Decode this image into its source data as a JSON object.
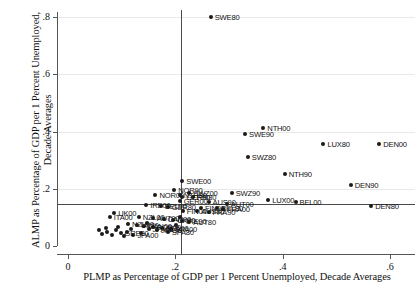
{
  "chart_data": {
    "type": "scatter",
    "title": "",
    "xlabel": "PLMP as Percentage of GDP per 1 Percent Unemployed, Decade Averages",
    "ylabel": "ALMP as Percentage of GDP per 1 Percent Unemployed, Decade Averages",
    "xlim": [
      -0.02,
      0.655
    ],
    "ylim": [
      -0.02,
      0.845
    ],
    "xticks": [
      0,
      0.2,
      0.4,
      0.6
    ],
    "xticklabels": [
      "0",
      ".2",
      ".4",
      ".6"
    ],
    "yticks": [
      0,
      0.2,
      0.4,
      0.6,
      0.8
    ],
    "yticklabels": [
      "0",
      ".2",
      ".4",
      ".6",
      ".8"
    ],
    "grid": "horizontal-faint",
    "legend": "none",
    "reference_lines": {
      "vertical_x": 0.21,
      "horizontal_y": 0.145
    },
    "points": [
      {
        "label": "SWE80",
        "x": 0.266,
        "y": 0.8,
        "label_pos": "right"
      },
      {
        "label": "SWE90",
        "x": 0.33,
        "y": 0.392,
        "label_pos": "right"
      },
      {
        "label": "NTH00",
        "x": 0.364,
        "y": 0.412,
        "label_pos": "right"
      },
      {
        "label": "LUX80",
        "x": 0.476,
        "y": 0.358,
        "label_pos": "right"
      },
      {
        "label": "DEN00",
        "x": 0.58,
        "y": 0.358,
        "label_pos": "right"
      },
      {
        "label": "SWZ80",
        "x": 0.335,
        "y": 0.312,
        "label_pos": "right"
      },
      {
        "label": "NTH90",
        "x": 0.404,
        "y": 0.252,
        "label_pos": "right"
      },
      {
        "label": "DEN90",
        "x": 0.527,
        "y": 0.212,
        "label_pos": "right"
      },
      {
        "label": "SWE00",
        "x": 0.213,
        "y": 0.228,
        "label_pos": "right"
      },
      {
        "label": "SWZ90",
        "x": 0.305,
        "y": 0.185,
        "label_pos": "right"
      },
      {
        "label": "LUX00",
        "x": 0.373,
        "y": 0.16,
        "label_pos": "right"
      },
      {
        "label": "BEL00",
        "x": 0.424,
        "y": 0.152,
        "label_pos": "right"
      },
      {
        "label": "DEN80",
        "x": 0.565,
        "y": 0.14,
        "label_pos": "right"
      },
      {
        "label": "NOR90",
        "x": 0.198,
        "y": 0.195,
        "label_pos": "right"
      },
      {
        "label": "NOR00",
        "x": 0.163,
        "y": 0.178,
        "label_pos": "right"
      },
      {
        "label": "SWZ00",
        "x": 0.226,
        "y": 0.184,
        "label_pos": "right"
      },
      {
        "label": "NTH80",
        "x": 0.208,
        "y": 0.178,
        "label_pos": "right"
      },
      {
        "label": "GER90",
        "x": 0.213,
        "y": 0.17,
        "label_pos": "right"
      },
      {
        "label": "FIN80",
        "x": 0.232,
        "y": 0.171,
        "label_pos": "right"
      },
      {
        "label": "GER00",
        "x": 0.208,
        "y": 0.158,
        "label_pos": "right"
      },
      {
        "label": "AUS90",
        "x": 0.262,
        "y": 0.152,
        "label_pos": "right"
      },
      {
        "label": "AUT00",
        "x": 0.296,
        "y": 0.148,
        "label_pos": "right"
      },
      {
        "label": "IRE00",
        "x": 0.146,
        "y": 0.143,
        "label_pos": "right"
      },
      {
        "label": "BEL90",
        "x": 0.173,
        "y": 0.141,
        "label_pos": "right"
      },
      {
        "label": "GER80",
        "x": 0.186,
        "y": 0.136,
        "label_pos": "right"
      },
      {
        "label": "FIN90",
        "x": 0.248,
        "y": 0.134,
        "label_pos": "right"
      },
      {
        "label": "BEL80",
        "x": 0.278,
        "y": 0.132,
        "label_pos": "right"
      },
      {
        "label": "FRA00",
        "x": 0.289,
        "y": 0.13,
        "label_pos": "right"
      },
      {
        "label": "FIN00",
        "x": 0.214,
        "y": 0.124,
        "label_pos": "right"
      },
      {
        "label": "AUS80",
        "x": 0.241,
        "y": 0.122,
        "label_pos": "right"
      },
      {
        "label": "FRA90",
        "x": 0.262,
        "y": 0.12,
        "label_pos": "right"
      },
      {
        "label": "UK00",
        "x": 0.086,
        "y": 0.116,
        "label_pos": "right"
      },
      {
        "label": "ITA00",
        "x": 0.078,
        "y": 0.103,
        "label_pos": "right"
      },
      {
        "label": "NZL00",
        "x": 0.132,
        "y": 0.1,
        "label_pos": "right"
      },
      {
        "label": "AUT90",
        "x": 0.158,
        "y": 0.097,
        "label_pos": "right"
      },
      {
        "label": "CAN90",
        "x": 0.178,
        "y": 0.093,
        "label_pos": "right"
      },
      {
        "label": "UK90",
        "x": 0.196,
        "y": 0.09,
        "label_pos": "right"
      },
      {
        "label": "IRE90",
        "x": 0.213,
        "y": 0.088,
        "label_pos": "right"
      },
      {
        "label": "AUT80",
        "x": 0.226,
        "y": 0.085,
        "label_pos": "right"
      },
      {
        "label": "NZL90",
        "x": 0.112,
        "y": 0.078,
        "label_pos": "right"
      },
      {
        "label": "UK80",
        "x": 0.128,
        "y": 0.074,
        "label_pos": "right"
      },
      {
        "label": "CAN00",
        "x": 0.142,
        "y": 0.07,
        "label_pos": "right"
      },
      {
        "label": "POR00",
        "x": 0.158,
        "y": 0.067,
        "label_pos": "right"
      },
      {
        "label": "SPA90",
        "x": 0.176,
        "y": 0.064,
        "label_pos": "right"
      },
      {
        "label": "SPA00",
        "x": 0.192,
        "y": 0.061,
        "label_pos": "right"
      },
      {
        "label": "JPA80",
        "x": 0.15,
        "y": 0.058,
        "label_pos": "right"
      },
      {
        "label": "JPA90",
        "x": 0.166,
        "y": 0.055,
        "label_pos": "right"
      },
      {
        "label": "GRE80",
        "x": 0.098,
        "y": 0.046,
        "label_pos": "right"
      },
      {
        "label": "POR90",
        "x": 0.11,
        "y": 0.05,
        "label_pos": "right"
      },
      {
        "label": "ITA90",
        "x": 0.09,
        "y": 0.055,
        "label_pos": "right"
      },
      {
        "label": "USA90",
        "x": 0.072,
        "y": 0.048,
        "label_pos": "right"
      },
      {
        "label": "USA00",
        "x": 0.064,
        "y": 0.042,
        "label_pos": "right"
      },
      {
        "label": "GRE90",
        "x": 0.082,
        "y": 0.038,
        "label_pos": "right"
      },
      {
        "label": "GRE00",
        "x": 0.104,
        "y": 0.035,
        "label_pos": "right"
      },
      {
        "label": "JPA00",
        "x": 0.122,
        "y": 0.04,
        "label_pos": "right"
      },
      {
        "label": "POR80",
        "x": 0.136,
        "y": 0.044,
        "label_pos": "right"
      },
      {
        "label": "SPA80",
        "x": 0.186,
        "y": 0.048,
        "label_pos": "right"
      },
      {
        "label": "CAN80",
        "x": 0.118,
        "y": 0.058,
        "label_pos": "right"
      },
      {
        "label": "ITA80",
        "x": 0.07,
        "y": 0.062,
        "label_pos": "right"
      },
      {
        "label": "USA80",
        "x": 0.058,
        "y": 0.055,
        "label_pos": "right"
      },
      {
        "label": "NZL80",
        "x": 0.094,
        "y": 0.068,
        "label_pos": "right"
      },
      {
        "label": "IRE80",
        "x": 0.148,
        "y": 0.082,
        "label_pos": "right"
      },
      {
        "label": "FRA80",
        "x": 0.202,
        "y": 0.075,
        "label_pos": "right"
      },
      {
        "label": "AUS00",
        "x": 0.208,
        "y": 0.1,
        "label_pos": "right"
      }
    ],
    "visible_labels": [
      "SWE80",
      "SWE90",
      "NTH00",
      "LUX80",
      "DEN00",
      "SWZ80",
      "NTH90",
      "DEN90",
      "SWE00",
      "SWZ90",
      "LUX00",
      "BEL00",
      "DEN80",
      "NOR90",
      "NOR00",
      "SWZ00",
      "NTH80",
      "GER90",
      "FIN80",
      "GER00",
      "AUS90",
      "AUT00",
      "IRE00",
      "BEL90",
      "GER80",
      "FIN90",
      "BEL80",
      "FRA00",
      "FIN00",
      "AUS80",
      "FRA90",
      "UK00",
      "ITA00",
      "NZL00",
      "AUT90",
      "CAN90",
      "UK90",
      "IRE90",
      "AUT80",
      "NZL90",
      "UK80",
      "CAN00",
      "POR00",
      "SPA90",
      "SPA00",
      "JPA80",
      "JPA90",
      "GRE80",
      "SPA80",
      "JPA00"
    ]
  }
}
